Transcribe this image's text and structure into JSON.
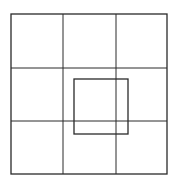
{
  "diagram": {
    "stroke_color": "#2a2a2a",
    "background": "#ffffff",
    "outer_square": {
      "x": 11,
      "y": 14,
      "width": 156,
      "height": 160
    },
    "grid": {
      "rows": 3,
      "cols": 3,
      "vertical_lines_x": [
        63,
        116
      ],
      "horizontal_lines_y": [
        68,
        121
      ]
    },
    "inner_square": {
      "x": 74,
      "y": 79,
      "width": 54,
      "height": 55
    }
  }
}
